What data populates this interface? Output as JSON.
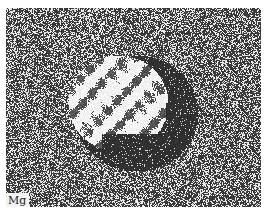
{
  "figure": {
    "type": "elemental-map micrograph",
    "element_label": "Mg",
    "colors": {
      "background": "#ffffff",
      "matrix_dark": "#3a3a3a",
      "speckle_light": "#d8d8d8",
      "particle_bright": "#f4f4f4",
      "depleted_core": "#303030",
      "label_bg": "#f2f2f2"
    }
  }
}
